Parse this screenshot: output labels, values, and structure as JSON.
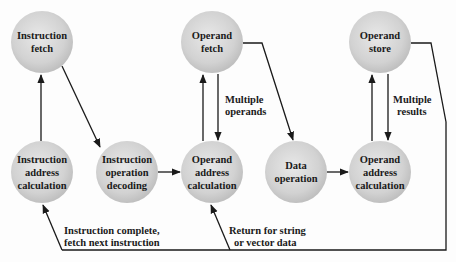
{
  "diagram": {
    "type": "state-diagram",
    "colors": {
      "background": "#fdfdfd",
      "node_fill_center": "#e6e6e6",
      "node_fill_edge": "#bdbdbd",
      "line": "#1a1a1a",
      "text": "#1a1a1a"
    },
    "nodes": [
      {
        "id": "instruction-fetch",
        "lines": [
          "Instruction",
          "fetch"
        ],
        "cx": 42,
        "cy": 42
      },
      {
        "id": "operand-fetch",
        "lines": [
          "Operand",
          "fetch"
        ],
        "cx": 212,
        "cy": 42
      },
      {
        "id": "operand-store",
        "lines": [
          "Operand",
          "store"
        ],
        "cx": 380,
        "cy": 42
      },
      {
        "id": "instruction-address-calculation",
        "lines": [
          "Instruction",
          "address",
          "calculation"
        ],
        "cx": 42,
        "cy": 172
      },
      {
        "id": "instruction-operation-decoding",
        "lines": [
          "Instruction",
          "operation",
          "decoding"
        ],
        "cx": 127,
        "cy": 172
      },
      {
        "id": "operand-address-calculation-1",
        "lines": [
          "Operand",
          "address",
          "calculation"
        ],
        "cx": 212,
        "cy": 172
      },
      {
        "id": "data-operation",
        "lines": [
          "Data",
          "operation"
        ],
        "cx": 296,
        "cy": 172
      },
      {
        "id": "operand-address-calculation-2",
        "lines": [
          "Operand",
          "address",
          "calculation"
        ],
        "cx": 380,
        "cy": 172
      }
    ],
    "edge_labels": {
      "multiple_operands": [
        "Multiple",
        "operands"
      ],
      "multiple_results": [
        "Multiple",
        "results"
      ],
      "instruction_complete": [
        "Instruction complete,",
        "fetch next instruction"
      ],
      "return_for_string": [
        "Return for string",
        "or vector data"
      ]
    },
    "edges": [
      {
        "from": "instruction-address-calculation",
        "to": "instruction-fetch"
      },
      {
        "from": "instruction-fetch",
        "to": "instruction-operation-decoding"
      },
      {
        "from": "instruction-operation-decoding",
        "to": "operand-address-calculation-1"
      },
      {
        "from": "operand-address-calculation-1",
        "to": "operand-fetch"
      },
      {
        "from": "operand-fetch",
        "to": "operand-address-calculation-1",
        "label": "Multiple operands"
      },
      {
        "from": "operand-fetch",
        "to": "data-operation"
      },
      {
        "from": "data-operation",
        "to": "operand-address-calculation-2"
      },
      {
        "from": "operand-address-calculation-2",
        "to": "operand-store"
      },
      {
        "from": "operand-store",
        "to": "operand-address-calculation-2",
        "label": "Multiple results"
      },
      {
        "from": "operand-store",
        "to": "instruction-address-calculation",
        "label": "Instruction complete, fetch next instruction"
      },
      {
        "from": "operand-store",
        "to": "operand-address-calculation-1",
        "label": "Return for string or vector data"
      }
    ]
  }
}
